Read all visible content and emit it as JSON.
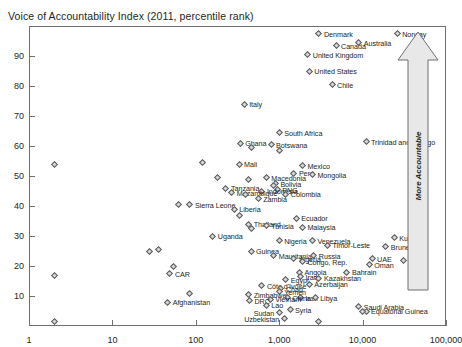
{
  "chart_data": {
    "type": "scatter",
    "title": "Voice of Accountability Index (2011, percentile rank)",
    "xlabel": "",
    "ylabel": "",
    "xscale": "log",
    "yscale": "linear",
    "xlim": [
      1,
      100000
    ],
    "ylim": [
      0,
      100
    ],
    "grid": false,
    "legend": null,
    "xticks": [
      "1",
      "10",
      "100",
      "1,000",
      "10,000",
      "100,000"
    ],
    "xtick_values": [
      1,
      10,
      100,
      1000,
      10000,
      100000
    ],
    "yticks": [
      "10",
      "20",
      "30",
      "40",
      "50",
      "60",
      "70",
      "80",
      "90"
    ],
    "ytick_values": [
      10,
      20,
      30,
      40,
      50,
      60,
      70,
      80,
      90
    ],
    "annotations": [
      {
        "name": "more-accountable-arrow",
        "text": "More Accountable",
        "direction": "up",
        "position": "right-inside"
      }
    ],
    "points": [
      {
        "label": "Denmark",
        "x": 3000,
        "y": 97.5,
        "side": "right"
      },
      {
        "label": "Norway",
        "x": 26000,
        "y": 97.5,
        "side": "right"
      },
      {
        "label": "Australia",
        "x": 9000,
        "y": 94.5,
        "side": "right"
      },
      {
        "label": "Canada",
        "x": 4800,
        "y": 93.5,
        "side": "right"
      },
      {
        "label": "United Kingdom",
        "x": 2200,
        "y": 90.5,
        "side": "right"
      },
      {
        "label": "United States",
        "x": 2300,
        "y": 85.0,
        "side": "right"
      },
      {
        "label": "Chile",
        "x": 4300,
        "y": 80.5,
        "side": "right"
      },
      {
        "label": "Italy",
        "x": 380,
        "y": 74.0,
        "side": "right"
      },
      {
        "label": "South Africa",
        "x": 1000,
        "y": 64.5,
        "side": "right"
      },
      {
        "label": "Trinidad and Tobago",
        "x": 11000,
        "y": 61.5,
        "side": "right"
      },
      {
        "label": "Ghana",
        "x": 340,
        "y": 61.0,
        "side": "right"
      },
      {
        "label": "Botswana",
        "x": 800,
        "y": 60.5,
        "side": "right"
      },
      {
        "label": "",
        "x": 470,
        "y": 59.5,
        "side": "right"
      },
      {
        "label": "",
        "x": 1000,
        "y": 58.5,
        "side": "right"
      },
      {
        "label": "",
        "x": 2,
        "y": 54.0,
        "side": "right"
      },
      {
        "label": "",
        "x": 120,
        "y": 54.5,
        "side": "right"
      },
      {
        "label": "Mali",
        "x": 330,
        "y": 54.0,
        "side": "right"
      },
      {
        "label": "Mexico",
        "x": 1900,
        "y": 53.5,
        "side": "right"
      },
      {
        "label": "Peru",
        "x": 1500,
        "y": 51.0,
        "side": "right"
      },
      {
        "label": "Mongolia",
        "x": 2500,
        "y": 50.5,
        "side": "right"
      },
      {
        "label": "",
        "x": 180,
        "y": 49.5,
        "side": "right"
      },
      {
        "label": "Macedonia",
        "x": 700,
        "y": 49.5,
        "side": "right"
      },
      {
        "label": "",
        "x": 430,
        "y": 49.0,
        "side": "right"
      },
      {
        "label": "Bolivia",
        "x": 900,
        "y": 47.5,
        "side": "right"
      },
      {
        "label": "",
        "x": 860,
        "y": 47.0,
        "side": "right"
      },
      {
        "label": "Tanzania",
        "x": 230,
        "y": 46.0,
        "side": "right"
      },
      {
        "label": "PNG",
        "x": 950,
        "y": 45.5,
        "side": "right"
      },
      {
        "label": "Indonesia",
        "x": 620,
        "y": 45.0,
        "side": "right"
      },
      {
        "label": "Mozambique",
        "x": 270,
        "y": 44.5,
        "side": "right"
      },
      {
        "label": "Colombia",
        "x": 1200,
        "y": 44.0,
        "side": "right"
      },
      {
        "label": "",
        "x": 390,
        "y": 44.0,
        "side": "right"
      },
      {
        "label": "Zambia",
        "x": 560,
        "y": 42.5,
        "side": "right"
      },
      {
        "label": "Sierra Leone",
        "x": 85,
        "y": 40.5,
        "side": "right"
      },
      {
        "label": "",
        "x": 62,
        "y": 40.5,
        "side": "right"
      },
      {
        "label": "Liberia",
        "x": 290,
        "y": 39.0,
        "side": "right"
      },
      {
        "label": "",
        "x": 330,
        "y": 37.0,
        "side": "right"
      },
      {
        "label": "Ecuador",
        "x": 1600,
        "y": 36.0,
        "side": "right"
      },
      {
        "label": "Thailand",
        "x": 430,
        "y": 34.0,
        "side": "right"
      },
      {
        "label": "Tunisia",
        "x": 700,
        "y": 33.5,
        "side": "right"
      },
      {
        "label": "Malaysia",
        "x": 1900,
        "y": 33.0,
        "side": "right"
      },
      {
        "label": "",
        "x": 470,
        "y": 32.5,
        "side": "right"
      },
      {
        "label": "Uganda",
        "x": 160,
        "y": 30.0,
        "side": "right"
      },
      {
        "label": "Nigeria",
        "x": 1000,
        "y": 28.5,
        "side": "right"
      },
      {
        "label": "Venezuela",
        "x": 2500,
        "y": 28.5,
        "side": "right"
      },
      {
        "label": "Kuwait",
        "x": 24000,
        "y": 29.5,
        "side": "right"
      },
      {
        "label": "Timor-Leste",
        "x": 3800,
        "y": 27.0,
        "side": "right"
      },
      {
        "label": "Brunei",
        "x": 19000,
        "y": 26.5,
        "side": "right"
      },
      {
        "label": "",
        "x": 28,
        "y": 25.0,
        "side": "right"
      },
      {
        "label": "",
        "x": 36,
        "y": 25.5,
        "side": "right"
      },
      {
        "label": "Guinea",
        "x": 460,
        "y": 25.0,
        "side": "right"
      },
      {
        "label": "Mauritania",
        "x": 860,
        "y": 23.5,
        "side": "right"
      },
      {
        "label": "Russia",
        "x": 2600,
        "y": 23.5,
        "side": "right"
      },
      {
        "label": "Algeria",
        "x": 1500,
        "y": 22.5,
        "side": "right"
      },
      {
        "label": "UAE",
        "x": 13000,
        "y": 22.5,
        "side": "right"
      },
      {
        "label": "Qatar",
        "x": 31000,
        "y": 22.0,
        "side": "right"
      },
      {
        "label": "Congo, Rep.",
        "x": 1900,
        "y": 21.5,
        "side": "right"
      },
      {
        "label": "Oman",
        "x": 12000,
        "y": 20.5,
        "side": "right"
      },
      {
        "label": "",
        "x": 54,
        "y": 20.0,
        "side": "right"
      },
      {
        "label": "",
        "x": 2,
        "y": 17.0,
        "side": "right"
      },
      {
        "label": "CAR",
        "x": 49,
        "y": 17.5,
        "side": "right"
      },
      {
        "label": "Angola",
        "x": 1750,
        "y": 18.0,
        "side": "right"
      },
      {
        "label": "Bahrain",
        "x": 6500,
        "y": 18.0,
        "side": "right"
      },
      {
        "label": "Iraq",
        "x": 1800,
        "y": 16.5,
        "side": "right"
      },
      {
        "label": "Kazakhstan",
        "x": 3000,
        "y": 16.0,
        "side": "right"
      },
      {
        "label": "Egypt",
        "x": 1200,
        "y": 15.5,
        "side": "right"
      },
      {
        "label": "Azerbaijan",
        "x": 2300,
        "y": 14.0,
        "side": "right"
      },
      {
        "label": "Côte d'Ivoire",
        "x": 620,
        "y": 13.5,
        "side": "right"
      },
      {
        "label": "Chad",
        "x": 1050,
        "y": 12.5,
        "side": "right"
      },
      {
        "label": "Yemen",
        "x": 1000,
        "y": 11.5,
        "side": "right"
      },
      {
        "label": "",
        "x": 85,
        "y": 11.0,
        "side": "right"
      },
      {
        "label": "Zimbabwe",
        "x": 430,
        "y": 10.5,
        "side": "right"
      },
      {
        "label": "Iran",
        "x": 1800,
        "y": 9.5,
        "side": "right"
      },
      {
        "label": "Libya",
        "x": 2700,
        "y": 9.5,
        "side": "right"
      },
      {
        "label": "China",
        "x": 1250,
        "y": 9.5,
        "side": "right"
      },
      {
        "label": "Vietnam",
        "x": 780,
        "y": 9.0,
        "side": "right"
      },
      {
        "label": "DRC",
        "x": 440,
        "y": 8.5,
        "side": "right"
      },
      {
        "label": "Afghanistan",
        "x": 46,
        "y": 8.0,
        "side": "right"
      },
      {
        "label": "Lao",
        "x": 700,
        "y": 7.0,
        "side": "right"
      },
      {
        "label": "Saudi Arabia",
        "x": 9000,
        "y": 6.5,
        "side": "right"
      },
      {
        "label": "Syria",
        "x": 1350,
        "y": 5.5,
        "side": "right"
      },
      {
        "label": "Equatorial Guinea",
        "x": 11000,
        "y": 5.0,
        "side": "right"
      },
      {
        "label": "Sudan",
        "x": 1000,
        "y": 4.5,
        "side": "left"
      },
      {
        "label": "Uzbekistan",
        "x": 1150,
        "y": 2.5,
        "side": "left"
      },
      {
        "label": "",
        "x": 2,
        "y": 1.5,
        "side": "right"
      },
      {
        "label": "",
        "x": 3000,
        "y": 1.5,
        "side": "right"
      },
      {
        "label": "",
        "x": 10000,
        "y": 5.0,
        "side": "right"
      }
    ]
  }
}
